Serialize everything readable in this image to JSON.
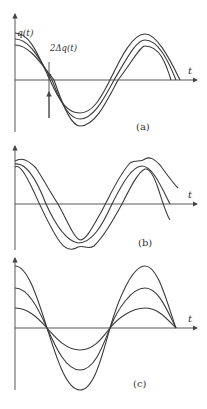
{
  "figure": {
    "panels": [
      {
        "id": "a",
        "caption": "(a)",
        "axis_label": "t",
        "annotations": {
          "signal": "q(t)",
          "band": "2Δq(t)"
        },
        "description": "Three parallel sinusoids offset vertically by a constant band"
      },
      {
        "id": "b",
        "caption": "(b)",
        "axis_label": "t",
        "description": "Three sinusoids shifted horizontally in time, envelope bands with ripples at extrema"
      },
      {
        "id": "c",
        "caption": "(c)",
        "axis_label": "t",
        "description": "Three sinusoids with different amplitudes sharing zero crossings"
      }
    ]
  }
}
